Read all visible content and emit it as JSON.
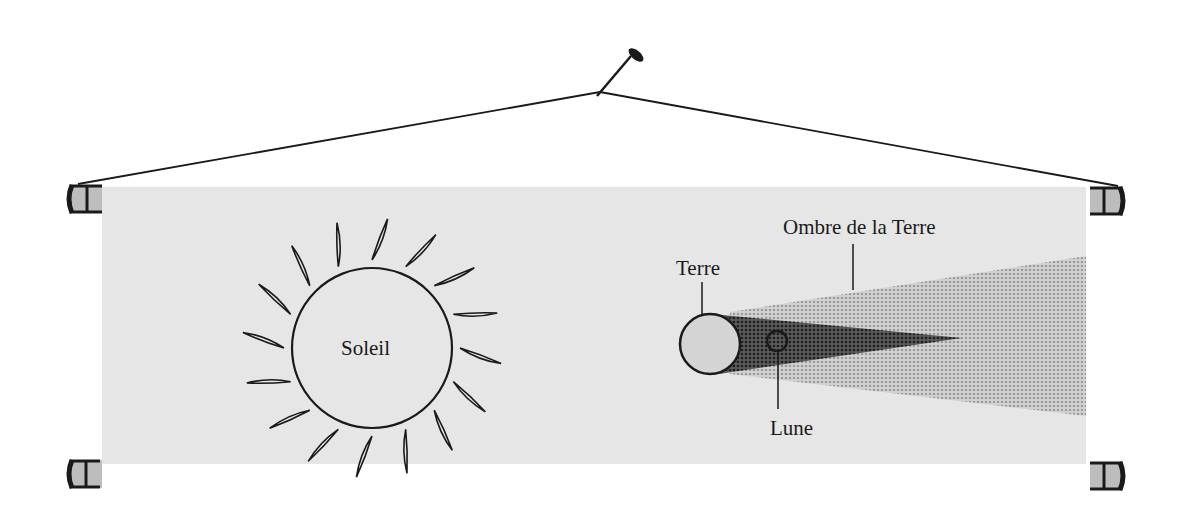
{
  "diagram": {
    "type": "lunar-eclipse-illustration",
    "banner": {
      "color": "#e6e6e6",
      "x": 102,
      "y": 187,
      "width": 984,
      "height": 277
    },
    "labels": {
      "sun": "Soleil",
      "earth": "Terre",
      "moon": "Lune",
      "earth_shadow": "Ombre de la Terre"
    },
    "colors": {
      "ink": "#1a1a1a",
      "banner": "#e6e6e6",
      "earth_fill": "#d4d4d4",
      "umbra": "#3c3c3c",
      "penumbra": "#b4b4b4",
      "roller_fill": "#bdbdbd"
    },
    "elements": [
      "nail",
      "hanging-string",
      "banner",
      "sun",
      "sun-rays",
      "earth",
      "umbra",
      "penumbra",
      "moon",
      "rollers"
    ]
  }
}
